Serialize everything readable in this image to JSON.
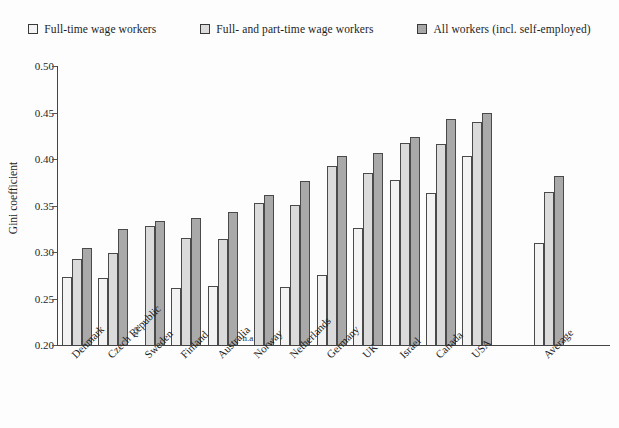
{
  "legend": {
    "items": [
      {
        "label": "Full-time wage workers",
        "swatch": "legend-swatch-light",
        "color": "#f4f4f4"
      },
      {
        "label": "Full- and part-time wage workers",
        "swatch": "legend-swatch-medium",
        "color": "#dcdcdc"
      },
      {
        "label": "All workers (incl. self-employed)",
        "swatch": "legend-swatch-dark",
        "color": "#a8a8a8"
      }
    ]
  },
  "axis": {
    "y_title": "Gini coefficient",
    "y_ticks": [
      "0.50",
      "0.45",
      "0.40",
      "0.35",
      "0.30",
      "0.25",
      "0.20"
    ]
  },
  "na_label": "n.a.",
  "chart_data": {
    "type": "bar",
    "title": "",
    "xlabel": "",
    "ylabel": "Gini coefficient",
    "ylim": [
      0.2,
      0.5
    ],
    "ytick_step": 0.05,
    "grid": false,
    "legend_position": "top",
    "categories": [
      "Denmark",
      "Czech Republic",
      "Sweden",
      "Finland",
      "Australia",
      "Norway",
      "Netherlands",
      "Germany",
      "UK",
      "Israel",
      "Canada",
      "USA",
      "Average"
    ],
    "series": [
      {
        "name": "Full-time wage workers",
        "color": "#f4f4f4",
        "values": [
          0.273,
          0.272,
          null,
          0.261,
          0.263,
          null,
          0.262,
          0.275,
          0.326,
          0.377,
          0.363,
          0.403,
          0.31
        ]
      },
      {
        "name": "Full- and part-time wage workers",
        "color": "#dcdcdc",
        "values": [
          0.293,
          0.299,
          0.328,
          0.315,
          0.314,
          0.353,
          0.351,
          0.392,
          0.385,
          0.417,
          0.416,
          0.44,
          0.364
        ]
      },
      {
        "name": "All workers (incl. self-employed)",
        "color": "#a8a8a8",
        "values": [
          0.304,
          0.325,
          0.333,
          0.337,
          0.343,
          0.361,
          0.376,
          0.403,
          0.406,
          0.424,
          0.443,
          0.45,
          0.382
        ]
      }
    ],
    "missing_data_note": "n.a.",
    "missing_entries": [
      {
        "category": "Sweden",
        "series": "Full-time wage workers"
      },
      {
        "category": "Norway",
        "series": "Full-time wage workers"
      }
    ]
  }
}
